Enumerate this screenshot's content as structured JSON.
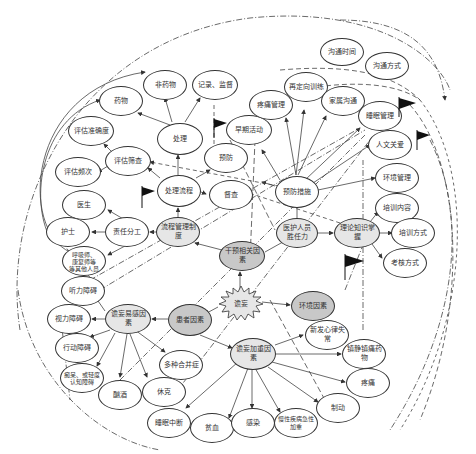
{
  "caption_partial": "……（图示上方被裁剪的说明文字）……",
  "center": {
    "label": "谵妄"
  },
  "nodes": {
    "ganyu": "干预相关因素",
    "liucheng": "流程管理制度",
    "chuli_liucheng": "处理流程",
    "chuli": "处理",
    "yaowu": "药物",
    "feiyaowu": "非药物",
    "jilu": "记录、监督",
    "pinggu_shaicha": "评估筛查",
    "pinggu_zhunque": "评估准确度",
    "pinggu_pinci": "评估频次",
    "zeren": "责任分工",
    "yisheng": "医生",
    "hushi": "护士",
    "qita": "呼吸师、\n康复师等\n等其他人员",
    "yufang": "预防",
    "ducha": "督查",
    "zaoqi": "早期活动",
    "yufang_cuoshi": "预防措施",
    "tengtong": "疼痛管理",
    "zaiding": "再定向训练",
    "jiashu": "家属沟通",
    "goutong_shijian": "沟通时间",
    "goutong_fangshi": "沟通方式",
    "shuimian": "睡眠管理",
    "renwen": "人文关爱",
    "huanjing_guanli": "环境管理",
    "peixun_neirong": "培训内容",
    "peixun_fangshi": "培训方式",
    "kaohe": "考核方式",
    "lilun": "理论知识掌握",
    "yihu": "医护人员\n胜任力",
    "huanjing": "环境因素",
    "huanzhe": "患者因素",
    "yigan": "谵妄易感因素",
    "tingli": "听力障碍",
    "shili": "视力障碍",
    "xingdong": "行动障碍",
    "chidai": "痴呆、或轻度\n认知障碍",
    "xujiu": "酗酒",
    "xiuke": "休克",
    "duozhong": "多种合并症",
    "jiazhong": "谵妄加重因素",
    "xinlv": "新发心律失常",
    "zhenjing": "镇静镇痛药物",
    "tengtong2": "疼痛",
    "zhidong": "制动",
    "shuimian_zhongduan": "睡眠中断",
    "pinxue": "贫血",
    "ganran": "感染",
    "manxing": "慢性疾病急性\n加重"
  },
  "colors": {
    "line": "#333333",
    "fill_light": "#e6e6e6",
    "fill_dark": "#c8c8c8",
    "flag": "#111111"
  }
}
